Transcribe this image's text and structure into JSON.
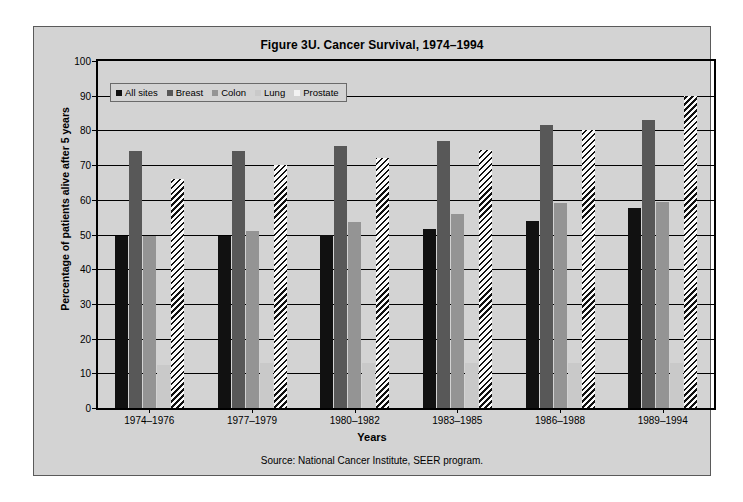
{
  "figure": {
    "title": "Figure 3U. Cancer Survival, 1974–1994",
    "source": "Source: National Cancer Institute, SEER program.",
    "frame_color": "#d3d3d3",
    "border_color": "#5a5a5a"
  },
  "chart_data": {
    "type": "bar",
    "title": "Figure 3U. Cancer Survival, 1974–1994",
    "xlabel": "Years",
    "ylabel": "Percentage of patients alive after 5 years",
    "ylim": [
      0,
      100
    ],
    "yticks": [
      0,
      10,
      20,
      30,
      40,
      50,
      60,
      70,
      80,
      90,
      100
    ],
    "grid": true,
    "legend_position": "upper-left-inside",
    "categories": [
      "1974–1976",
      "1977–1979",
      "1980–1982",
      "1983–1985",
      "1986–1988",
      "1989–1994"
    ],
    "series": [
      {
        "name": "All sites",
        "color": "#111111",
        "pattern": "solid",
        "values": [
          49.5,
          49.5,
          50.0,
          51.5,
          54.0,
          57.5
        ]
      },
      {
        "name": "Breast",
        "color": "#585858",
        "pattern": "solid",
        "values": [
          74.0,
          74.0,
          75.5,
          77.0,
          81.5,
          83.0
        ]
      },
      {
        "name": "Colon",
        "color": "#949494",
        "pattern": "solid",
        "values": [
          49.5,
          51.0,
          53.5,
          56.0,
          59.0,
          59.5
        ]
      },
      {
        "name": "Lung",
        "color": "#c9c9c9",
        "pattern": "solid",
        "values": [
          12.5,
          13.0,
          13.0,
          13.0,
          13.0,
          13.0
        ]
      },
      {
        "name": "Prostate",
        "color": "#fbfbfb",
        "pattern": "diagonal-hatch",
        "values": [
          66.0,
          70.0,
          72.0,
          74.5,
          80.0,
          90.0
        ]
      }
    ],
    "annotations": [
      "Source: National Cancer Institute, SEER program."
    ]
  }
}
